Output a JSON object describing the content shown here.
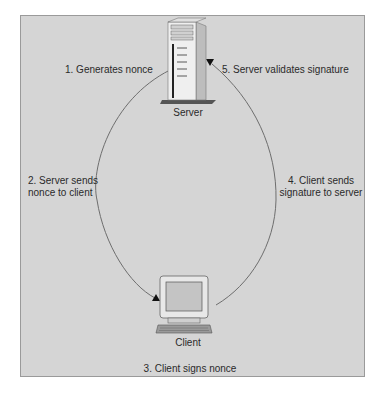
{
  "diagram": {
    "type": "nonce-authentication-flow",
    "nodes": {
      "server": {
        "label": "Server",
        "icon": "server-tower-icon"
      },
      "client": {
        "label": "Client",
        "icon": "desktop-computer-icon"
      }
    },
    "steps": [
      {
        "number": 1,
        "text": "1. Generates nonce"
      },
      {
        "number": 2,
        "text": "2. Server sends nonce to client",
        "line1": "2. Server sends",
        "line2": "nonce to client"
      },
      {
        "number": 3,
        "text": "3. Client signs nonce"
      },
      {
        "number": 4,
        "text": "4. Client sends signature to server",
        "line1": "4. Client sends",
        "line2": "signature to server"
      },
      {
        "number": 5,
        "text": "5. Server validates signature"
      }
    ],
    "edges": [
      {
        "from": "server",
        "to": "client",
        "side": "left",
        "step": 2
      },
      {
        "from": "client",
        "to": "server",
        "side": "right",
        "step": 4
      }
    ],
    "colors": {
      "background": "#d5d5d5",
      "border": "#9a9a9a",
      "line": "#6e6e6e",
      "text": "#2a2a2a"
    }
  }
}
